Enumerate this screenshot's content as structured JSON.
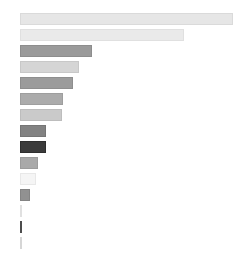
{
  "chart_data": {
    "type": "bar",
    "orientation": "horizontal",
    "title": "",
    "subtitle": "",
    "xlabel": "",
    "ylabel": "",
    "grid": false,
    "legend": "none",
    "axis_visible": false,
    "tick_labels_visible": false,
    "categories": [
      "",
      "",
      "",
      "",
      "",
      "",
      "",
      "",
      "",
      "",
      "",
      "",
      "",
      "",
      ""
    ],
    "values": [
      100.0,
      77.0,
      33.8,
      27.7,
      24.9,
      20.2,
      19.7,
      12.2,
      12.2,
      8.5,
      7.5,
      4.7,
      0.9,
      0.9,
      0.5
    ],
    "xlim": [
      0,
      100
    ],
    "ylim": [
      0,
      15
    ],
    "bar_colors": [
      "#e6e6e6",
      "#eaeaea",
      "#9a9a9a",
      "#d5d5d5",
      "#9b9b9b",
      "#ababab",
      "#cacaca",
      "#828282",
      "#3b3b3b",
      "#a9a9a9",
      "#f5f5f5",
      "#919191",
      "#ededed",
      "#5a5a5a",
      "#e3e3e3"
    ],
    "bar_edge_colors": [
      "#dadada",
      "#e0e0e0",
      "#8d8d8d",
      "#c8c8c8",
      "#8e8e8e",
      "#9e9e9e",
      "#bdbdbd",
      "#757575",
      "#2e2e2e",
      "#9c9c9c",
      "#e8e8e8",
      "#848484",
      "#e0e0e0",
      "#4d4d4d",
      "#d6d6d6"
    ],
    "background_color": "#ffffff",
    "plot_left_px": 20,
    "plot_right_px": 233,
    "bar_height_px": 12,
    "bar_gap_px": 4
  }
}
